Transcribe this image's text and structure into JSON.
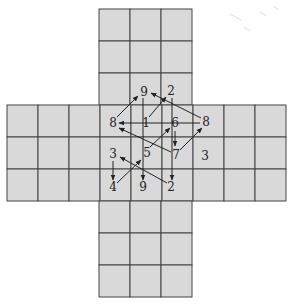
{
  "diagram": {
    "title": "",
    "grid": {
      "cell_size": 31,
      "arms": [
        {
          "name": "top",
          "x": 99,
          "y": 9,
          "cols": 3,
          "rows": 3
        },
        {
          "name": "middle",
          "x": 7,
          "y": 105,
          "cols": 9,
          "rows": 3
        },
        {
          "name": "bottom",
          "x": 99,
          "y": 201,
          "cols": 3,
          "rows": 3
        }
      ],
      "fill_color": "#d9d9d9",
      "line_color": "#444444"
    },
    "nodes": [
      {
        "id": "n9a",
        "label": "9",
        "x": 144,
        "y": 92
      },
      {
        "id": "n2a",
        "label": "2",
        "x": 171,
        "y": 91
      },
      {
        "id": "n8l",
        "label": "8",
        "x": 113,
        "y": 123
      },
      {
        "id": "n1",
        "label": "1",
        "x": 146,
        "y": 123
      },
      {
        "id": "n6",
        "label": "6",
        "x": 175,
        "y": 123
      },
      {
        "id": "n8r",
        "label": "8",
        "x": 206,
        "y": 122
      },
      {
        "id": "n3l",
        "label": "3",
        "x": 113,
        "y": 154
      },
      {
        "id": "n5",
        "label": "5",
        "x": 147,
        "y": 153
      },
      {
        "id": "n7",
        "label": "7",
        "x": 176,
        "y": 155
      },
      {
        "id": "n3r",
        "label": "3",
        "x": 205,
        "y": 156
      },
      {
        "id": "n4",
        "label": "4",
        "x": 113,
        "y": 187
      },
      {
        "id": "n9b",
        "label": "9",
        "x": 143,
        "y": 187
      },
      {
        "id": "n2b",
        "label": "2",
        "x": 171,
        "y": 187
      }
    ],
    "arrows": [
      {
        "from": "n8l",
        "to": "n9a",
        "x1": 117,
        "y1": 117,
        "x2": 138,
        "y2": 96
      },
      {
        "from": "n1",
        "to": "n2a",
        "x1": 149,
        "y1": 117,
        "x2": 166,
        "y2": 97
      },
      {
        "from": "n8r",
        "to": "n9a",
        "x1": 201,
        "y1": 118,
        "x2": 151,
        "y2": 93
      },
      {
        "from": "n8r",
        "to": "n8l",
        "x1": 200,
        "y1": 123,
        "x2": 119,
        "y2": 123
      },
      {
        "from": "n7",
        "to": "n8l",
        "x1": 171,
        "y1": 152,
        "x2": 119,
        "y2": 128
      },
      {
        "from": "n6",
        "to": "n7",
        "x1": 175,
        "y1": 131,
        "x2": 175,
        "y2": 146
      },
      {
        "from": "n7",
        "to": "n8r",
        "x1": 180,
        "y1": 150,
        "x2": 202,
        "y2": 128
      },
      {
        "from": "n5",
        "to": "n6",
        "x1": 150,
        "y1": 147,
        "x2": 170,
        "y2": 128
      },
      {
        "from": "n2a",
        "to": "n2b",
        "x1": 172,
        "y1": 98,
        "x2": 172,
        "y2": 180
      },
      {
        "from": "n9a",
        "to": "n9b",
        "x1": 143,
        "y1": 98,
        "x2": 143,
        "y2": 180
      },
      {
        "from": "n3l",
        "to": "n4",
        "x1": 113,
        "y1": 161,
        "x2": 113,
        "y2": 180
      },
      {
        "from": "n4",
        "to": "n5",
        "x1": 117,
        "y1": 183,
        "x2": 141,
        "y2": 160
      },
      {
        "from": "n2b",
        "to": "n3l",
        "x1": 167,
        "y1": 183,
        "x2": 120,
        "y2": 157
      }
    ]
  }
}
